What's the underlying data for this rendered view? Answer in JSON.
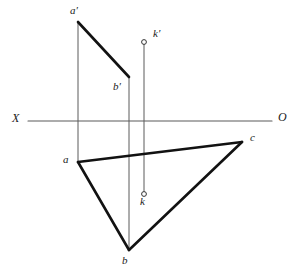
{
  "figure": {
    "canvas": {
      "width": 298,
      "height": 276
    },
    "colors": {
      "background": "#ffffff",
      "thick_line": "#121212",
      "thin_line": "#5a5a5a",
      "label_text": "#1a1a1a"
    },
    "stroke_widths": {
      "thick": 2.6,
      "thin": 1.0,
      "axis": 1.1
    }
  },
  "axis": {
    "name": "ground-line",
    "x1": 28,
    "y1": 121,
    "x2": 272,
    "y2": 121,
    "left_label": "X",
    "right_label": "O",
    "left_label_pos": {
      "x": 12,
      "y": 113
    },
    "right_label_pos": {
      "x": 278,
      "y": 112
    }
  },
  "points": [
    {
      "id": "a_prime",
      "label": "a′",
      "x": 78,
      "y": 22,
      "label_x": 70,
      "label_y": 6,
      "marker": "none"
    },
    {
      "id": "b_prime",
      "label": "b′",
      "x": 129,
      "y": 77,
      "label_x": 114,
      "label_y": 82,
      "marker": "none"
    },
    {
      "id": "k_prime",
      "label": "k′",
      "x": 144,
      "y": 42,
      "label_x": 153,
      "label_y": 29,
      "marker": "circle"
    },
    {
      "id": "a",
      "label": "a",
      "x": 78,
      "y": 162,
      "label_x": 63,
      "label_y": 155,
      "marker": "none"
    },
    {
      "id": "b",
      "label": "b",
      "x": 129,
      "y": 250,
      "label_x": 122,
      "label_y": 256,
      "marker": "none"
    },
    {
      "id": "c",
      "label": "c",
      "x": 242,
      "y": 142,
      "label_x": 250,
      "label_y": 133,
      "marker": "none"
    },
    {
      "id": "k",
      "label": "k",
      "x": 144,
      "y": 194,
      "label_x": 140,
      "label_y": 197,
      "marker": "circle"
    }
  ],
  "thick_segments": [
    {
      "id": "seg-a-prime-b-prime",
      "from": "a_prime",
      "to": "b_prime",
      "x1": 78,
      "y1": 22,
      "x2": 129,
      "y2": 77
    },
    {
      "id": "seg-a-c",
      "from": "a",
      "to": "c",
      "x1": 78,
      "y1": 162,
      "x2": 242,
      "y2": 142
    },
    {
      "id": "seg-a-b",
      "from": "a",
      "to": "b",
      "x1": 78,
      "y1": 162,
      "x2": 129,
      "y2": 250
    },
    {
      "id": "seg-b-c",
      "from": "b",
      "to": "c",
      "x1": 129,
      "y1": 250,
      "x2": 242,
      "y2": 142
    }
  ],
  "projection_lines": [
    {
      "id": "proj-a",
      "from": "a_prime",
      "to": "a",
      "x1": 78,
      "y1": 22,
      "x2": 78,
      "y2": 162
    },
    {
      "id": "proj-b",
      "from": "b_prime",
      "to": "b",
      "x1": 129,
      "y1": 77,
      "x2": 129,
      "y2": 250
    },
    {
      "id": "proj-k",
      "from": "k_prime",
      "to": "k",
      "x1": 144,
      "y1": 44,
      "x2": 144,
      "y2": 192
    }
  ],
  "markers": [
    {
      "id": "marker-k-prime",
      "x": 144,
      "y": 42,
      "r": 2.4
    },
    {
      "id": "marker-k",
      "x": 144,
      "y": 194,
      "r": 2.4
    }
  ]
}
